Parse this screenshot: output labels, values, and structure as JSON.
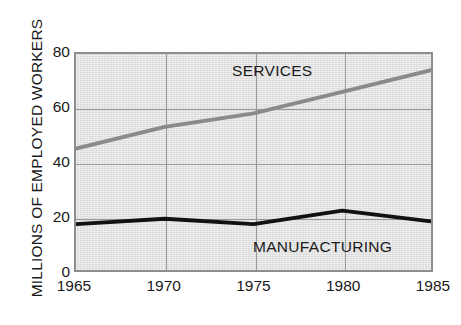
{
  "chart_data": {
    "type": "line",
    "title": "",
    "subtitle": "",
    "xlabel": "",
    "ylabel": "MILLIONS OF EMPLOYED WORKERS",
    "x": [
      1965,
      1970,
      1975,
      1980,
      1985
    ],
    "xtick_labels": [
      "1965",
      "1970",
      "1975",
      "1980",
      "1985"
    ],
    "ytick_labels": [
      "0",
      "20",
      "40",
      "60",
      "80"
    ],
    "yticks": [
      0,
      20,
      40,
      60,
      80
    ],
    "xlim": [
      1965,
      1985
    ],
    "ylim": [
      0,
      80
    ],
    "grid": "both",
    "legend_position": "inline-annotation",
    "plot_background": "#e2e2e2",
    "series": [
      {
        "name": "SERVICES",
        "color": "#8a8a8a",
        "line_width": 4,
        "values": [
          45,
          53,
          58,
          66,
          74
        ]
      },
      {
        "name": "MANUFACTURING",
        "color": "#111111",
        "line_width": 4,
        "values": [
          17,
          19,
          17,
          22,
          18
        ]
      }
    ],
    "annotations": [
      {
        "text": "SERVICES",
        "series": "SERVICES"
      },
      {
        "text": "MANUFACTURING",
        "series": "MANUFACTURING"
      }
    ]
  },
  "axis": {
    "y_title": "MILLIONS OF EMPLOYED WORKERS",
    "y_ticks": [
      {
        "label": "80",
        "value": 80
      },
      {
        "label": "60",
        "value": 60
      },
      {
        "label": "40",
        "value": 40
      },
      {
        "label": "20",
        "value": 20
      },
      {
        "label": "0",
        "value": 0
      }
    ],
    "x_ticks": [
      {
        "label": "1965",
        "value": 1965
      },
      {
        "label": "1970",
        "value": 1970
      },
      {
        "label": "1975",
        "value": 1975
      },
      {
        "label": "1980",
        "value": 1980
      },
      {
        "label": "1985",
        "value": 1985
      }
    ]
  },
  "labels": {
    "services": "SERVICES",
    "manufacturing": "MANUFACTURING"
  },
  "colors": {
    "services_line": "#8a8a8a",
    "manufacturing_line": "#111111",
    "plot_background": "#e2e2e2",
    "gridline": "#9a9a9a",
    "frame": "#8e8e8e",
    "text": "#1a1a1a",
    "page_background": "#ffffff"
  }
}
